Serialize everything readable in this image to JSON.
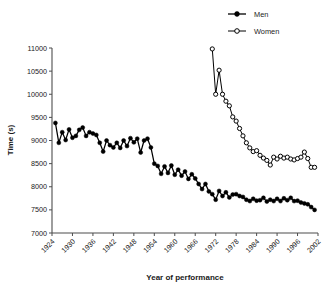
{
  "chart_data": {
    "type": "line",
    "title": "",
    "xlabel": "Year of performance",
    "ylabel": "Time (s)",
    "xlim": [
      1924,
      2002
    ],
    "ylim": [
      7000,
      11000
    ],
    "grid": false,
    "legend_position": "top-right",
    "x_ticks": [
      "1924",
      "1930",
      "1936",
      "1942",
      "1948",
      "1954",
      "1960",
      "1966",
      "1972",
      "1978",
      "1984",
      "1990",
      "1996",
      "2002"
    ],
    "y_ticks": [
      "7000",
      "7500",
      "8000",
      "8500",
      "9000",
      "9500",
      "10000",
      "10500",
      "11000"
    ],
    "series": [
      {
        "name": "Men",
        "marker": "filled-circle",
        "color": "#000000",
        "x": [
          1925,
          1926,
          1927,
          1928,
          1929,
          1930,
          1931,
          1932,
          1933,
          1934,
          1935,
          1936,
          1937,
          1938,
          1939,
          1940,
          1941,
          1942,
          1943,
          1944,
          1945,
          1946,
          1947,
          1948,
          1949,
          1950,
          1951,
          1952,
          1953,
          1954,
          1955,
          1956,
          1957,
          1958,
          1959,
          1960,
          1961,
          1962,
          1963,
          1964,
          1965,
          1966,
          1967,
          1968,
          1969,
          1970,
          1971,
          1972,
          1973,
          1974,
          1975,
          1976,
          1977,
          1978,
          1979,
          1980,
          1981,
          1982,
          1983,
          1984,
          1985,
          1986,
          1987,
          1988,
          1989,
          1990,
          1991,
          1992,
          1993,
          1994,
          1995,
          1996,
          1997,
          1998,
          1999,
          2000,
          2001
        ],
        "values": [
          9380,
          8950,
          9180,
          9010,
          9240,
          9060,
          9100,
          9230,
          9280,
          9100,
          9180,
          9150,
          9120,
          8950,
          8760,
          9000,
          8900,
          8850,
          8950,
          8840,
          9000,
          8880,
          9050,
          8960,
          9040,
          8740,
          9000,
          9040,
          8850,
          8500,
          8450,
          8280,
          8440,
          8300,
          8460,
          8260,
          8370,
          8240,
          8330,
          8170,
          8270,
          8180,
          8060,
          7950,
          8060,
          7900,
          7840,
          7720,
          7910,
          7800,
          7880,
          7770,
          7830,
          7840,
          7800,
          7780,
          7720,
          7690,
          7740,
          7700,
          7710,
          7760,
          7680,
          7720,
          7690,
          7740,
          7690,
          7750,
          7710,
          7760,
          7690,
          7700,
          7660,
          7640,
          7620,
          7560,
          7500
        ]
      },
      {
        "name": "Women",
        "marker": "open-circle",
        "color": "#000000",
        "x": [
          1971,
          1972,
          1973,
          1974,
          1975,
          1976,
          1977,
          1978,
          1979,
          1980,
          1981,
          1982,
          1983,
          1984,
          1985,
          1986,
          1987,
          1988,
          1989,
          1990,
          1991,
          1992,
          1993,
          1994,
          1995,
          1996,
          1997,
          1998,
          1999,
          2000,
          2001
        ],
        "values": [
          10980,
          10000,
          10520,
          10000,
          9850,
          9750,
          9510,
          9420,
          9260,
          9100,
          8950,
          8840,
          8760,
          8780,
          8680,
          8620,
          8570,
          8470,
          8640,
          8600,
          8660,
          8620,
          8640,
          8600,
          8580,
          8610,
          8640,
          8750,
          8610,
          8420,
          8420
        ]
      }
    ]
  },
  "legend": {
    "entries": [
      {
        "label": "Men",
        "marker": "filled-circle"
      },
      {
        "label": "Women",
        "marker": "open-circle"
      }
    ]
  }
}
